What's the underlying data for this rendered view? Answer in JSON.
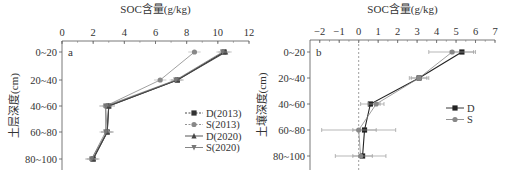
{
  "chart_data": [
    {
      "type": "line",
      "panel_label": "a",
      "title": "SOC含量(g/kg)",
      "xlabel": "SOC含量(g/kg)",
      "ylabel": "土层深度(cm)",
      "xlim": [
        0,
        12
      ],
      "xticks": [
        0,
        2,
        4,
        6,
        8,
        10,
        12
      ],
      "categories": [
        "0~20",
        "20~40",
        "40~60",
        "60~80",
        "80~100"
      ],
      "series": [
        {
          "name": "D(2013)",
          "marker": "square",
          "color": "#333333",
          "values": [
            10.4,
            7.4,
            3.0,
            2.9,
            2.0
          ]
        },
        {
          "name": "S(2013)",
          "marker": "circle",
          "color": "#888888",
          "values": [
            8.5,
            6.3,
            2.8,
            2.9,
            1.9
          ]
        },
        {
          "name": "D(2020)",
          "marker": "triangle-up",
          "color": "#444444",
          "values": [
            10.5,
            7.4,
            3.0,
            2.9,
            2.0
          ]
        },
        {
          "name": "S(2020)",
          "marker": "triangle-down",
          "color": "#777777",
          "values": [
            10.3,
            7.3,
            2.8,
            2.8,
            1.9
          ]
        }
      ],
      "legend_position": "right-center"
    },
    {
      "type": "line",
      "panel_label": "b",
      "title": "SOC含量(g/kg)",
      "xlabel": "SOC含量(g/kg)",
      "ylabel": "土壤深度(cm)",
      "xlim": [
        -2.5,
        7
      ],
      "xticks": [
        -2,
        -1,
        0,
        1,
        2,
        3,
        4,
        5,
        6,
        7
      ],
      "reference_line_x": 0,
      "categories": [
        "0~20",
        "20~40",
        "40~60",
        "60~80",
        "80~100"
      ],
      "series": [
        {
          "name": "D",
          "marker": "square",
          "color": "#222222",
          "values": [
            5.3,
            3.1,
            0.6,
            0.3,
            0.2
          ],
          "errors": [
            0.6,
            0.5,
            0.5,
            0.6,
            0.5
          ]
        },
        {
          "name": "S",
          "marker": "circle",
          "color": "#888888",
          "values": [
            4.8,
            3.1,
            0.9,
            0.0,
            0.1
          ],
          "errors": [
            1.2,
            0.4,
            0.4,
            1.9,
            1.3
          ]
        }
      ],
      "legend_position": "right-center"
    }
  ]
}
